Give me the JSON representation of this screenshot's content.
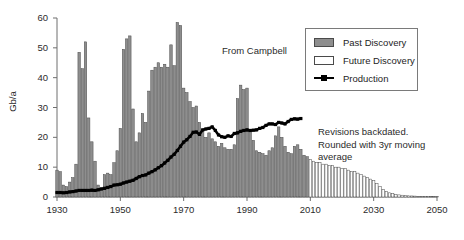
{
  "chart_data": {
    "type": "bar",
    "title": "",
    "subtitle": "",
    "xlabel": "",
    "ylabel": "Gb/a",
    "xlim": [
      1930,
      2050
    ],
    "ylim": [
      0,
      60
    ],
    "grid": false,
    "legend_position": "top-right",
    "xticks": [
      "1930",
      "1950",
      "1970",
      "1990",
      "2010",
      "2030",
      "2050"
    ],
    "xtick_values": [
      1930,
      1950,
      1970,
      1990,
      2010,
      2030,
      2050
    ],
    "yticks": [
      "0",
      "10",
      "20",
      "30",
      "40",
      "50",
      "60"
    ],
    "ytick_values": [
      0,
      10,
      20,
      30,
      40,
      50,
      60
    ],
    "x": [
      1930,
      1931,
      1932,
      1933,
      1934,
      1935,
      1936,
      1937,
      1938,
      1939,
      1940,
      1941,
      1942,
      1943,
      1944,
      1945,
      1946,
      1947,
      1948,
      1949,
      1950,
      1951,
      1952,
      1953,
      1954,
      1955,
      1956,
      1957,
      1958,
      1959,
      1960,
      1961,
      1962,
      1963,
      1964,
      1965,
      1966,
      1967,
      1968,
      1969,
      1970,
      1971,
      1972,
      1973,
      1974,
      1975,
      1976,
      1977,
      1978,
      1979,
      1980,
      1981,
      1982,
      1983,
      1984,
      1985,
      1986,
      1987,
      1988,
      1989,
      1990,
      1991,
      1992,
      1993,
      1994,
      1995,
      1996,
      1997,
      1998,
      1999,
      2000,
      2001,
      2002,
      2003,
      2004,
      2005,
      2006,
      2007,
      2008,
      2009,
      2010,
      2011,
      2012,
      2013,
      2014,
      2015,
      2016,
      2017,
      2018,
      2019,
      2020,
      2021,
      2022,
      2023,
      2024,
      2025,
      2026,
      2027,
      2028,
      2029,
      2030,
      2031,
      2032,
      2033,
      2034,
      2035,
      2036,
      2037,
      2038,
      2039,
      2040,
      2041,
      2042,
      2043,
      2044,
      2045,
      2046,
      2047,
      2048,
      2049,
      2050
    ],
    "series": [
      {
        "name": "Past Discovery",
        "type": "bar",
        "color": "#8e8e8e",
        "edge_color": "#4a4a4a",
        "values": [
          9.0,
          8.5,
          4.0,
          3.5,
          5.0,
          6.5,
          11.0,
          48.5,
          43.0,
          52.0,
          26.5,
          18.5,
          12.0,
          4.0,
          3.0,
          7.5,
          8.0,
          7.5,
          11.5,
          15.5,
          23.0,
          49.5,
          53.0,
          54.0,
          29.5,
          18.5,
          21.5,
          28.0,
          25.0,
          35.5,
          42.5,
          43.5,
          45.0,
          43.5,
          44.5,
          43.5,
          51.0,
          44.0,
          58.5,
          57.5,
          36.5,
          35.0,
          32.0,
          30.0,
          30.5,
          25.0,
          22.5,
          20.0,
          21.5,
          19.5,
          18.5,
          17.0,
          18.0,
          16.5,
          16.0,
          16.0,
          17.5,
          33.0,
          37.5,
          36.0,
          36.5,
          22.0,
          19.0,
          15.5,
          15.0,
          14.5,
          14.0,
          15.5,
          16.5,
          20.5,
          23.5,
          20.0,
          17.0,
          15.0,
          14.5,
          17.0,
          17.5,
          16.0,
          14.0,
          13.5,
          null,
          null,
          null,
          null,
          null,
          null,
          null,
          null,
          null,
          null,
          null,
          null,
          null,
          null,
          null,
          null,
          null,
          null,
          null,
          null,
          null,
          null,
          null,
          null,
          null,
          null,
          null,
          null,
          null,
          null,
          null,
          null,
          null,
          null,
          null,
          null,
          null,
          null,
          null,
          null,
          null
        ]
      },
      {
        "name": "Future Discovery",
        "type": "bar",
        "color": "#ffffff",
        "edge_color": "#4a4a4a",
        "values": [
          null,
          null,
          null,
          null,
          null,
          null,
          null,
          null,
          null,
          null,
          null,
          null,
          null,
          null,
          null,
          null,
          null,
          null,
          null,
          null,
          null,
          null,
          null,
          null,
          null,
          null,
          null,
          null,
          null,
          null,
          null,
          null,
          null,
          null,
          null,
          null,
          null,
          null,
          null,
          null,
          null,
          null,
          null,
          null,
          null,
          null,
          null,
          null,
          null,
          null,
          null,
          null,
          null,
          null,
          null,
          null,
          null,
          null,
          null,
          null,
          null,
          null,
          null,
          null,
          null,
          null,
          null,
          null,
          null,
          null,
          null,
          null,
          null,
          null,
          null,
          null,
          null,
          null,
          null,
          null,
          12.5,
          12.0,
          11.5,
          11.5,
          11.0,
          11.0,
          10.5,
          10.5,
          10.0,
          10.0,
          9.5,
          9.5,
          9.0,
          8.5,
          8.5,
          8.0,
          7.5,
          7.0,
          6.5,
          6.0,
          5.5,
          4.5,
          3.5,
          2.5,
          1.8,
          1.4,
          1.1,
          0.9,
          0.7,
          0.6,
          0.5,
          0.4,
          0.35,
          0.3,
          0.25,
          0.2,
          0.2,
          0.15,
          0.15,
          0.1,
          0.1
        ]
      },
      {
        "name": "Production",
        "type": "line",
        "color": "#000000",
        "marker": "square",
        "values": [
          1.5,
          1.5,
          1.4,
          1.5,
          1.7,
          1.8,
          2.0,
          2.2,
          2.2,
          2.2,
          2.2,
          2.3,
          2.2,
          2.4,
          2.7,
          2.9,
          3.2,
          3.5,
          4.0,
          4.1,
          4.3,
          4.7,
          5.0,
          5.3,
          5.6,
          6.2,
          6.8,
          7.2,
          7.4,
          8.0,
          8.5,
          9.1,
          9.8,
          10.5,
          11.4,
          12.3,
          13.4,
          14.3,
          15.6,
          17.0,
          18.4,
          19.2,
          20.3,
          21.7,
          21.8,
          21.0,
          22.5,
          22.8,
          23.0,
          23.5,
          22.3,
          20.8,
          20.2,
          20.0,
          20.5,
          20.3,
          21.3,
          21.5,
          22.0,
          22.3,
          22.5,
          22.3,
          22.4,
          22.5,
          23.0,
          23.3,
          24.0,
          24.5,
          24.5,
          24.3,
          25.0,
          24.8,
          24.5,
          25.3,
          26.0,
          26.2,
          26.1,
          26.3,
          null,
          null,
          null,
          null,
          null,
          null,
          null,
          null,
          null,
          null,
          null,
          null,
          null,
          null,
          null,
          null,
          null,
          null,
          null,
          null,
          null,
          null,
          null,
          null,
          null,
          null,
          null,
          null,
          null,
          null,
          null,
          null,
          null,
          null,
          null,
          null,
          null,
          null,
          null,
          null,
          null,
          null,
          null
        ]
      }
    ],
    "annotations": [
      {
        "id": "from-campbell",
        "text": "From Campbell",
        "x": 1981,
        "y": 47
      },
      {
        "id": "note",
        "text": "Revisions backdated. Rounded with 3yr moving average",
        "x": 2013,
        "y": 21
      }
    ]
  },
  "legend": {
    "items": [
      {
        "label": "Past Discovery",
        "swatch": "filled-gray-rect"
      },
      {
        "label": "Future Discovery",
        "swatch": "empty-white-rect"
      },
      {
        "label": "Production",
        "swatch": "black-line-with-square-marker"
      }
    ]
  },
  "annotations": {
    "from_campbell": "From Campbell",
    "note_line1": "Revisions backdated.",
    "note_line2": "Rounded with 3yr moving",
    "note_line3": "average"
  },
  "axes": {
    "ylabel": "Gb/a"
  },
  "colors": {
    "past_discovery": "#8e8e8e",
    "future_discovery": "#ffffff",
    "bar_edge": "#4a4a4a",
    "production_line": "#000000",
    "axis": "#6f6f6f",
    "text": "#2b2b2b"
  }
}
